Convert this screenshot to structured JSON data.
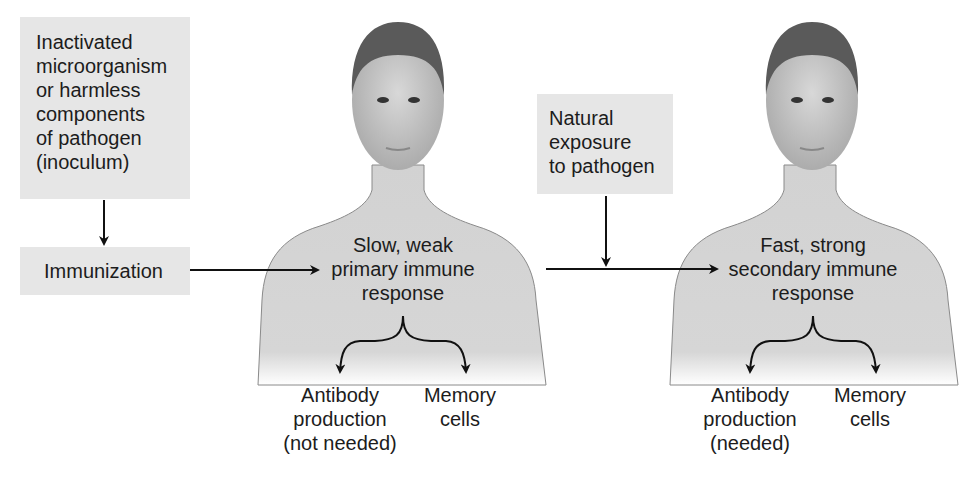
{
  "diagram": {
    "inoculum_box": {
      "lines": [
        "Inactivated",
        "microorganism",
        "or harmless",
        "components",
        "of pathogen",
        "(inoculum)"
      ]
    },
    "immunization_box": {
      "label": "Immunization"
    },
    "natural_exposure_box": {
      "lines": [
        "Natural",
        "exposure",
        "to pathogen"
      ]
    },
    "primary_person": {
      "response_lines": [
        "Slow, weak",
        "primary immune",
        "response"
      ],
      "outcome_left_lines": [
        "Antibody",
        "production",
        "(not needed)"
      ],
      "outcome_right_lines": [
        "Memory",
        "cells"
      ]
    },
    "secondary_person": {
      "response_lines": [
        "Fast, strong",
        "secondary immune",
        "response"
      ],
      "outcome_left_lines": [
        "Antibody",
        "production",
        "(needed)"
      ],
      "outcome_right_lines": [
        "Memory",
        "cells"
      ]
    },
    "colors": {
      "box_fill": "#e6e6e6",
      "skin": "#cfcfcf",
      "skin_dark": "#9a9a9a",
      "hair": "#5a5a5a",
      "arrow": "#111111"
    }
  }
}
